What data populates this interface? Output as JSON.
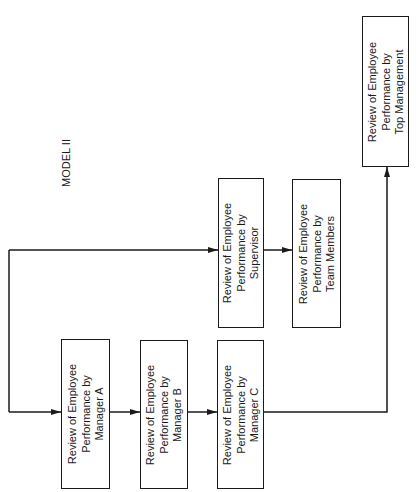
{
  "diagram": {
    "title": "MODEL II",
    "stroke_color": "#1a1a1a",
    "background": "#ffffff",
    "orientation": "rotated -90deg (page turned sideways)",
    "nodes": [
      {
        "id": "manager_a",
        "label": "Review of Employee\nPerformance by\nManager A"
      },
      {
        "id": "manager_b",
        "label": "Review of Employee\nPerformance by\nManager B"
      },
      {
        "id": "manager_c",
        "label": "Review of Employee\nPerformance by\nManager C"
      },
      {
        "id": "supervisor",
        "label": "Review of Employee\nPerformance by\nSupervisor"
      },
      {
        "id": "team_members",
        "label": "Review of Employee\nPerformance by\nTeam Members"
      },
      {
        "id": "top_management",
        "label": "Review of Employee\nPerformance by\nTop Management"
      }
    ],
    "edges": [
      {
        "from": "start",
        "to": "manager_a"
      },
      {
        "from": "start",
        "to": "supervisor"
      },
      {
        "from": "manager_a",
        "to": "manager_b"
      },
      {
        "from": "manager_b",
        "to": "manager_c"
      },
      {
        "from": "supervisor",
        "to": "team_members"
      },
      {
        "from": "manager_c",
        "to": "top_management"
      }
    ]
  }
}
